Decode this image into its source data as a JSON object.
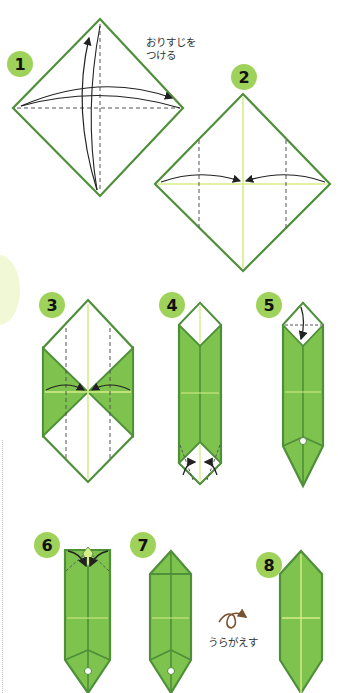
{
  "colors": {
    "outline": "#4f8f3a",
    "fill": "#7ec34d",
    "fill_light": "#8fcc5c",
    "crease_light": "#d7ee88",
    "badge": "#9fd25a",
    "deco": "#f1f8d6",
    "arrow": "#222222",
    "flip_icon": "#7a5230",
    "dashed": "#555555"
  },
  "steps": [
    {
      "number": "1",
      "note": "おりすじを\nつける"
    },
    {
      "number": "2"
    },
    {
      "number": "3"
    },
    {
      "number": "4"
    },
    {
      "number": "5"
    },
    {
      "number": "6"
    },
    {
      "number": "7"
    },
    {
      "number": "8"
    }
  ],
  "flip": {
    "icon": "flip-over-icon",
    "label": "うらがえす"
  }
}
